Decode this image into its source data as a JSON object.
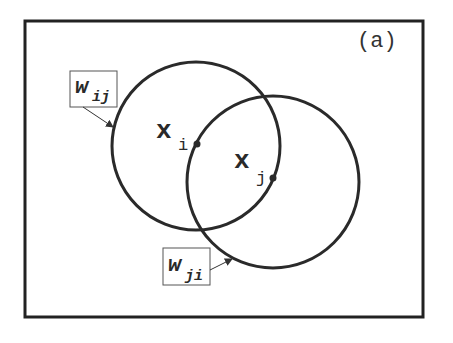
{
  "figure": {
    "panel_label": "(a)",
    "frame": {
      "x": 25,
      "y": 21,
      "width": 398,
      "height": 296,
      "stroke": "#222222"
    },
    "circles": [
      {
        "id": "circle-i",
        "cx": 196,
        "cy": 146,
        "r": 84,
        "stroke": "#2a2a2a"
      },
      {
        "id": "circle-j",
        "cx": 273,
        "cy": 182,
        "r": 86,
        "stroke": "#2a2a2a"
      }
    ],
    "points": [
      {
        "id": "x_i",
        "base": "x",
        "sub": "i",
        "label_x": 156,
        "label_y": 138,
        "dot_x": 197,
        "dot_y": 144
      },
      {
        "id": "x_j",
        "base": "x",
        "sub": "j",
        "label_x": 234,
        "label_y": 168,
        "dot_x": 273,
        "dot_y": 178
      }
    ],
    "weights": [
      {
        "id": "w_ij",
        "base": "w",
        "sub": "ij",
        "box_x": 70,
        "box_y": 71,
        "box_w": 47,
        "box_h": 36,
        "arrow_from": [
          83,
          107
        ],
        "arrow_to": [
          113,
          127
        ]
      },
      {
        "id": "w_ji",
        "base": "w",
        "sub": "ji",
        "box_x": 163,
        "box_y": 248,
        "box_w": 47,
        "box_h": 37,
        "arrow_from": [
          210,
          270
        ],
        "arrow_to": [
          232,
          259
        ]
      }
    ]
  }
}
